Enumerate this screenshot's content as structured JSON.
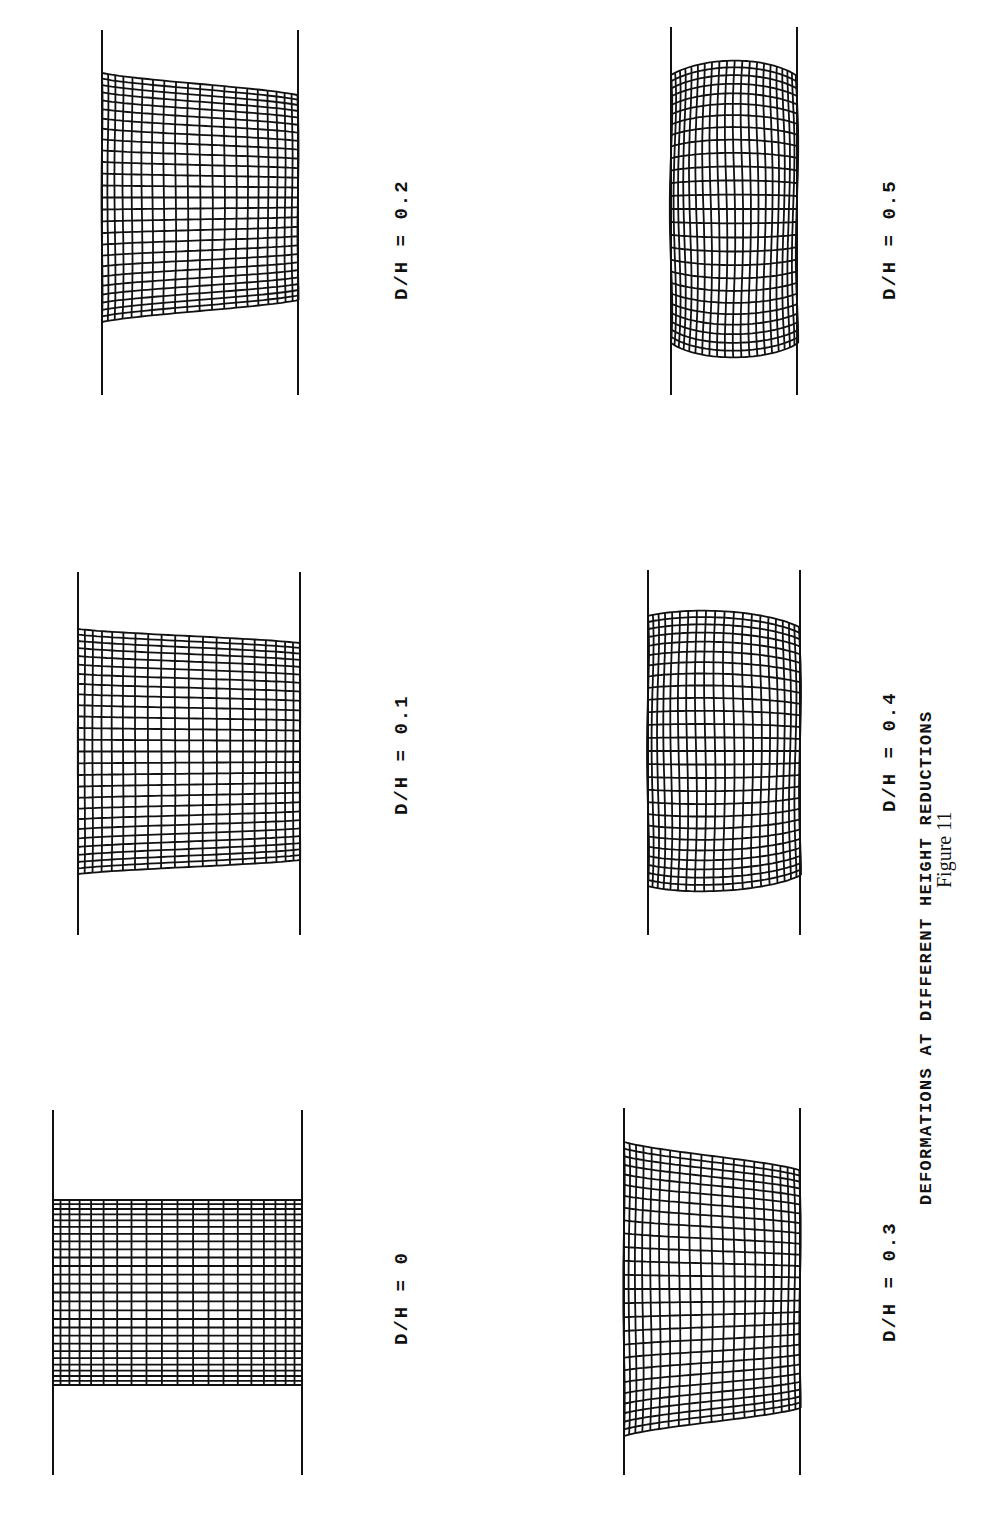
{
  "figure": {
    "caption": "DEFORMATIONS AT DIFFERENT HEIGHT REDUCTIONS",
    "number": "Figure 11",
    "orientation": "rotated 90° counter-clockwise (text reads bottom-to-top)"
  },
  "panels": [
    {
      "id": "p0",
      "label": "D/H = 0",
      "ratio": 0.0,
      "platen_x": [
        53,
        302
      ],
      "platen_y": [
        1110,
        1475
      ],
      "mesh_y": [
        1200,
        1385
      ],
      "bulge": 0,
      "skew": 0
    },
    {
      "id": "p01",
      "label": "D/H = 0.1",
      "ratio": 0.1,
      "platen_x": [
        78,
        300
      ],
      "platen_y": [
        572,
        935
      ],
      "mesh_y": [
        643,
        860
      ],
      "bulge": 14,
      "skew": 1
    },
    {
      "id": "p02",
      "label": "D/H = 0.2",
      "ratio": 0.2,
      "platen_x": [
        102,
        298
      ],
      "platen_y": [
        30,
        395
      ],
      "mesh_y": [
        95,
        300
      ],
      "bulge": 22,
      "skew": 1
    },
    {
      "id": "p03",
      "label": "D/H = 0.3",
      "ratio": 0.3,
      "platen_x": [
        624,
        800
      ],
      "platen_y": [
        1108,
        1475
      ],
      "mesh_y": [
        1170,
        1408
      ],
      "bulge": 28,
      "skew": 1
    },
    {
      "id": "p04",
      "label": "D/H = 0.4",
      "ratio": 0.4,
      "platen_x": [
        648,
        800
      ],
      "platen_y": [
        570,
        935
      ],
      "mesh_y": [
        627,
        875
      ],
      "bulge": 28,
      "skew": 0.4
    },
    {
      "id": "p05",
      "label": "D/H = 0.5",
      "ratio": 0.5,
      "platen_x": [
        671,
        797
      ],
      "platen_y": [
        27,
        395
      ],
      "mesh_y": [
        75,
        343
      ],
      "bulge": 24,
      "skew": 0
    }
  ],
  "mesh": {
    "columns": 20,
    "rows": 26,
    "line_color": "#111111",
    "platen_color": "#111111"
  },
  "labels_layout": {
    "p0": {
      "x": 393,
      "y": 1345
    },
    "p01": {
      "x": 393,
      "y": 815
    },
    "p02": {
      "x": 393,
      "y": 300
    },
    "p03": {
      "x": 881,
      "y": 1342
    },
    "p04": {
      "x": 881,
      "y": 812
    },
    "p05": {
      "x": 881,
      "y": 300
    },
    "caption": {
      "x": 918,
      "y": 1205
    },
    "number": {
      "x": 934,
      "y": 888
    }
  }
}
